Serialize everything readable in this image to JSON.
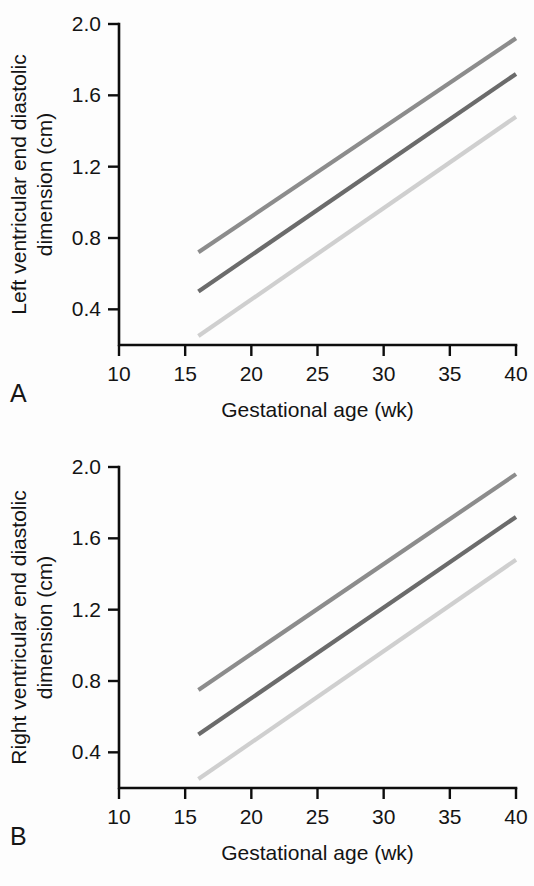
{
  "figure": {
    "panels": [
      {
        "letter": "A",
        "ylabel_line1": "Left ventricular end diastolic",
        "ylabel_line2": "dimension (cm)",
        "xlabel": "Gestational age (wk)"
      },
      {
        "letter": "B",
        "ylabel_line1": "Right ventricular end diastolic",
        "ylabel_line2": "dimension (cm)",
        "xlabel": "Gestational age (wk)"
      }
    ]
  },
  "chart_data": [
    {
      "type": "line",
      "title": "",
      "panel": "A",
      "xlabel": "Gestational age (wk)",
      "ylabel": "Left ventricular end diastolic dimension (cm)",
      "xlim": [
        10,
        40
      ],
      "ylim": [
        0.2,
        2.0
      ],
      "xticks": [
        10,
        15,
        20,
        25,
        30,
        35,
        40
      ],
      "yticks": [
        0.4,
        0.8,
        1.2,
        1.6,
        2.0
      ],
      "xtick_labels": [
        "10",
        "15",
        "20",
        "25",
        "30",
        "35",
        "40"
      ],
      "ytick_labels": [
        "0.4",
        "0.8",
        "1.2",
        "1.6",
        "2.0"
      ],
      "grid": false,
      "legend": "none",
      "x": [
        16,
        40
      ],
      "series": [
        {
          "name": "upper limit",
          "color": "#8c8c8c",
          "values": [
            0.72,
            1.92
          ]
        },
        {
          "name": "mean",
          "color": "#6b6b6b",
          "values": [
            0.5,
            1.72
          ]
        },
        {
          "name": "lower limit",
          "color": "#cfcfcf",
          "values": [
            0.25,
            1.48
          ]
        }
      ]
    },
    {
      "type": "line",
      "title": "",
      "panel": "B",
      "xlabel": "Gestational age (wk)",
      "ylabel": "Right ventricular end diastolic dimension (cm)",
      "xlim": [
        10,
        40
      ],
      "ylim": [
        0.2,
        2.0
      ],
      "xticks": [
        10,
        15,
        20,
        25,
        30,
        35,
        40
      ],
      "yticks": [
        0.4,
        0.8,
        1.2,
        1.6,
        2.0
      ],
      "xtick_labels": [
        "10",
        "15",
        "20",
        "25",
        "30",
        "35",
        "40"
      ],
      "ytick_labels": [
        "0.4",
        "0.8",
        "1.2",
        "1.6",
        "2.0"
      ],
      "grid": false,
      "legend": "none",
      "x": [
        16,
        40
      ],
      "series": [
        {
          "name": "upper limit",
          "color": "#8c8c8c",
          "values": [
            0.75,
            1.96
          ]
        },
        {
          "name": "mean",
          "color": "#6b6b6b",
          "values": [
            0.5,
            1.72
          ]
        },
        {
          "name": "lower limit",
          "color": "#cfcfcf",
          "values": [
            0.25,
            1.48
          ]
        }
      ]
    }
  ]
}
